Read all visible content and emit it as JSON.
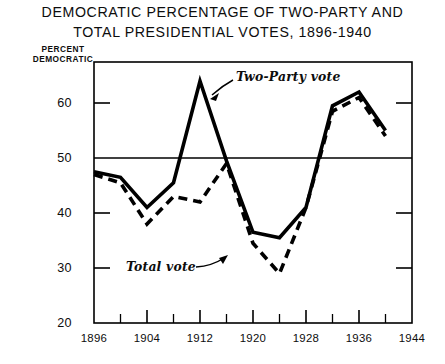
{
  "chart_data": {
    "type": "line",
    "title": "DEMOCRATIC PERCENTAGE OF TWO-PARTY AND TOTAL PRESIDENTIAL VOTES, 1896-1940",
    "title_lines": [
      "DEMOCRATIC PERCENTAGE OF TWO-PARTY AND",
      "TOTAL PRESIDENTIAL VOTES, 1896-1940"
    ],
    "xlabel": "",
    "ylabel": "PERCENT DEMOCRATIC",
    "ylabel_lines": [
      "PERCENT",
      "DEMOCRATIC"
    ],
    "x": [
      1896,
      1900,
      1904,
      1908,
      1912,
      1916,
      1920,
      1924,
      1928,
      1932,
      1936,
      1940
    ],
    "xlim": [
      1896,
      1944
    ],
    "ylim": [
      20,
      65
    ],
    "yticks": [
      20,
      30,
      40,
      50,
      60
    ],
    "ytick_labels": [
      "20",
      "30",
      "40",
      "50",
      "60"
    ],
    "xticks": [
      1896,
      1904,
      1912,
      1920,
      1928,
      1936,
      1944
    ],
    "xtick_labels": [
      "1896",
      "1904",
      "1912",
      "1920",
      "1928",
      "1936",
      "1944"
    ],
    "xminor_ticks": [
      1900,
      1908,
      1916,
      1924,
      1932,
      1940
    ],
    "grid": false,
    "reference_line": {
      "value": 50,
      "label": "50 percent line",
      "style": "solid-thin"
    },
    "legend": "inline-annotations",
    "series": [
      {
        "name": "Two-Party vote",
        "style": "solid",
        "color": "#000000",
        "annotation": "Two-Party vote",
        "values": [
          47.5,
          46.5,
          41.0,
          45.5,
          64.0,
          49.5,
          36.5,
          35.5,
          41.0,
          59.5,
          62.0,
          55.0
        ]
      },
      {
        "name": "Total vote",
        "style": "dashed",
        "color": "#000000",
        "annotation": "Total vote",
        "values": [
          47.0,
          45.5,
          38.0,
          43.0,
          42.0,
          49.0,
          34.5,
          29.0,
          41.0,
          58.5,
          61.0,
          54.0
        ]
      }
    ]
  }
}
